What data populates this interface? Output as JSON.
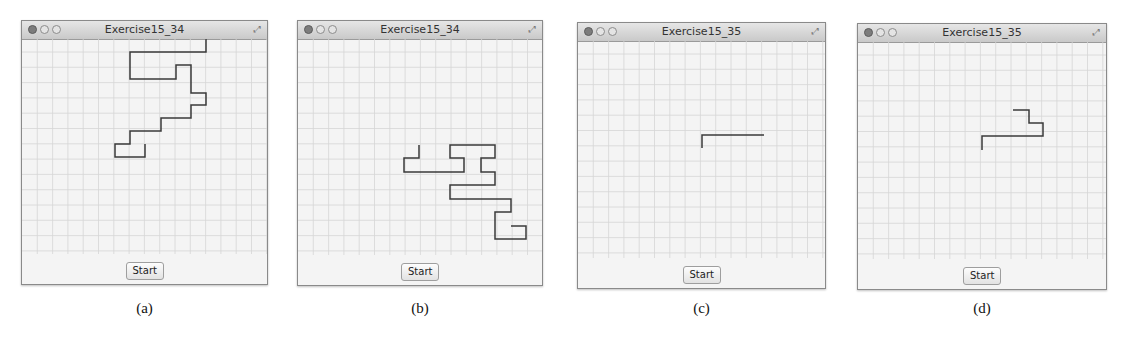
{
  "panels": [
    {
      "id": "a",
      "title": "Exercise15_34",
      "button_label": "Start",
      "caption": "(a)",
      "window": {
        "x": 21,
        "y": 20,
        "w": 247,
        "h": 265
      },
      "path": [
        [
          206,
          38
        ],
        [
          206,
          51
        ],
        [
          130,
          51
        ],
        [
          130,
          78
        ],
        [
          176,
          78
        ],
        [
          176,
          64
        ],
        [
          191,
          64
        ],
        [
          191,
          92
        ],
        [
          206,
          92
        ],
        [
          206,
          104
        ],
        [
          191,
          104
        ],
        [
          191,
          117
        ],
        [
          161,
          117
        ],
        [
          161,
          130
        ],
        [
          130,
          130
        ],
        [
          130,
          143
        ],
        [
          115,
          143
        ],
        [
          115,
          156
        ],
        [
          145,
          156
        ],
        [
          145,
          143
        ]
      ]
    },
    {
      "id": "b",
      "title": "Exercise15_34",
      "button_label": "Start",
      "caption": "(b)",
      "window": {
        "x": 297,
        "y": 20,
        "w": 246,
        "h": 266
      },
      "path": [
        [
          419,
          144
        ],
        [
          419,
          157
        ],
        [
          404,
          157
        ],
        [
          404,
          171
        ],
        [
          464,
          171
        ],
        [
          464,
          157
        ],
        [
          450,
          157
        ],
        [
          450,
          144
        ],
        [
          495,
          144
        ],
        [
          495,
          157
        ],
        [
          481,
          157
        ],
        [
          481,
          171
        ],
        [
          495,
          171
        ],
        [
          495,
          184
        ],
        [
          450,
          184
        ],
        [
          450,
          198
        ],
        [
          511,
          198
        ],
        [
          511,
          211
        ],
        [
          495,
          211
        ],
        [
          495,
          238
        ],
        [
          526,
          238
        ],
        [
          526,
          225
        ],
        [
          511,
          225
        ]
      ]
    },
    {
      "id": "c",
      "title": "Exercise15_35",
      "button_label": "Start",
      "caption": "(c)",
      "window": {
        "x": 577,
        "y": 22,
        "w": 249,
        "h": 267
      },
      "path": [
        [
          702,
          147
        ],
        [
          702,
          134
        ],
        [
          764,
          134
        ]
      ]
    },
    {
      "id": "d",
      "title": "Exercise15_35",
      "button_label": "Start",
      "caption": "(d)",
      "window": {
        "x": 857,
        "y": 23,
        "w": 250,
        "h": 267
      },
      "path": [
        [
          982,
          149
        ],
        [
          982,
          135
        ],
        [
          1043,
          135
        ],
        [
          1043,
          122
        ],
        [
          1029,
          122
        ],
        [
          1029,
          109
        ],
        [
          1013,
          109
        ]
      ]
    }
  ],
  "grid": {
    "cell": 15.3,
    "line_color": "#d6d6d6",
    "path_color": "#3a3a3a"
  }
}
